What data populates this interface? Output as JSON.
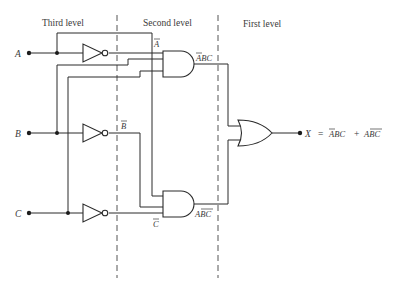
{
  "levels": {
    "third": "Third level",
    "second": "Second level",
    "first": "First level"
  },
  "inputs": {
    "a": "A",
    "b": "B",
    "c": "C"
  },
  "signals": {
    "a_not": "A",
    "b_not": "B",
    "c_not": "C",
    "and_top_out": "ABC",
    "and_bottom_out": "ABC"
  },
  "output": {
    "name": "X",
    "equals": "=",
    "term1": "ABC",
    "plus": "+",
    "term2": "ABC"
  },
  "gates": [
    {
      "type": "NOT",
      "input": "A",
      "output": "A'"
    },
    {
      "type": "NOT",
      "input": "B",
      "output": "B'"
    },
    {
      "type": "NOT",
      "input": "C",
      "output": "C'"
    },
    {
      "type": "AND",
      "inputs": [
        "A'",
        "B",
        "C"
      ],
      "output": "A'BC"
    },
    {
      "type": "AND",
      "inputs": [
        "A",
        "B'",
        "C'"
      ],
      "output": "AB'C'"
    },
    {
      "type": "OR",
      "inputs": [
        "A'BC",
        "AB'C'"
      ],
      "output": "X"
    }
  ]
}
